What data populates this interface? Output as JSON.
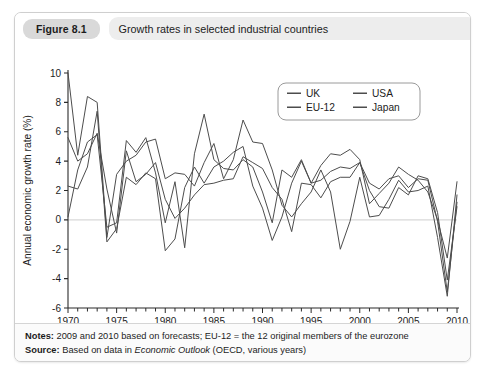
{
  "figure": {
    "number": "Figure 8.1",
    "title": "Growth rates in selected industrial countries"
  },
  "footer": {
    "notes_label": "Notes:",
    "notes_text": " 2009 and 2010 based on forecasts; EU-12 = the 12 original members of the eurozone",
    "source_label": "Source:",
    "source_pre": " Based on data in ",
    "source_italic": "Economic Outlook",
    "source_post": " (OECD, various years)"
  },
  "chart_data": {
    "type": "line",
    "title": "Growth rates in selected industrial countries",
    "xlabel": "",
    "ylabel": "Annual economic growth rate (%)",
    "xlim": [
      1970,
      2010
    ],
    "ylim": [
      -6,
      10
    ],
    "ytick_values": [
      -6,
      -4,
      -2,
      0,
      2,
      4,
      6,
      8,
      10
    ],
    "ytick_labels": [
      "-6",
      "-4",
      "-2",
      "0",
      "2",
      "4",
      "6",
      "8",
      "10"
    ],
    "xtick_values": [
      1970,
      1975,
      1980,
      1985,
      1990,
      1995,
      2000,
      2005,
      2010
    ],
    "xtick_labels": [
      "1970",
      "1975",
      "1980",
      "1985",
      "1990",
      "1995",
      "2000",
      "2005",
      "2010"
    ],
    "minor_xtick_interval": 1,
    "grid": false,
    "zero_line": true,
    "zero_line_color": "#d8d8d8",
    "line_color": "#4d4d4d",
    "legend_position": "top-right",
    "x": [
      1970,
      1971,
      1972,
      1973,
      1974,
      1975,
      1976,
      1977,
      1978,
      1979,
      1980,
      1981,
      1982,
      1983,
      1984,
      1985,
      1986,
      1987,
      1988,
      1989,
      1990,
      1991,
      1992,
      1993,
      1994,
      1995,
      1996,
      1997,
      1998,
      1999,
      2000,
      2001,
      2002,
      2003,
      2004,
      2005,
      2006,
      2007,
      2008,
      2009,
      2010
    ],
    "series": [
      {
        "name": "UK",
        "color": "#4d4d4d",
        "values": [
          2.3,
          2.1,
          3.6,
          7.4,
          -1.5,
          -0.6,
          2.9,
          2.4,
          3.2,
          2.8,
          -2.1,
          -1.3,
          2.2,
          3.6,
          2.5,
          3.6,
          4.0,
          4.6,
          5.0,
          2.3,
          0.8,
          -1.4,
          0.2,
          2.5,
          4.0,
          2.5,
          2.7,
          3.3,
          3.6,
          3.5,
          3.9,
          2.5,
          2.1,
          2.8,
          3.0,
          2.2,
          2.8,
          2.7,
          -0.1,
          -4.9,
          1.2
        ]
      },
      {
        "name": "USA",
        "color": "#4d4d4d",
        "values": [
          0.2,
          3.4,
          5.3,
          5.8,
          -0.5,
          -0.2,
          5.4,
          4.6,
          5.6,
          3.2,
          -0.2,
          2.6,
          -1.9,
          4.5,
          7.2,
          4.1,
          3.5,
          3.4,
          4.1,
          3.6,
          1.9,
          -0.2,
          3.4,
          2.9,
          4.1,
          2.5,
          3.7,
          4.5,
          4.4,
          4.8,
          4.1,
          1.1,
          1.8,
          2.5,
          3.6,
          3.1,
          2.7,
          1.9,
          0.0,
          -2.6,
          2.6
        ]
      },
      {
        "name": "EU-12",
        "color": "#4d4d4d",
        "values": [
          5.6,
          4.0,
          4.5,
          5.9,
          2.1,
          -0.9,
          4.7,
          2.6,
          3.1,
          3.9,
          1.4,
          0.1,
          0.8,
          1.7,
          2.4,
          2.5,
          2.7,
          2.8,
          4.3,
          3.9,
          3.5,
          2.2,
          1.4,
          -0.8,
          2.5,
          2.4,
          1.5,
          2.6,
          2.9,
          2.9,
          3.9,
          2.0,
          0.9,
          0.8,
          2.2,
          1.7,
          3.0,
          2.8,
          0.5,
          -4.1,
          0.9
        ]
      },
      {
        "name": "Japan",
        "color": "#4d4d4d",
        "values": [
          10.0,
          4.4,
          8.4,
          8.0,
          -1.2,
          3.1,
          4.0,
          4.4,
          5.3,
          5.5,
          2.8,
          3.2,
          3.1,
          2.3,
          3.9,
          5.2,
          2.8,
          4.1,
          6.8,
          5.3,
          5.2,
          3.4,
          1.0,
          0.2,
          1.1,
          1.9,
          3.4,
          1.9,
          -2.0,
          -0.1,
          2.9,
          0.2,
          0.3,
          1.4,
          2.7,
          1.9,
          2.0,
          2.3,
          -1.2,
          -5.2,
          1.7
        ]
      }
    ]
  }
}
